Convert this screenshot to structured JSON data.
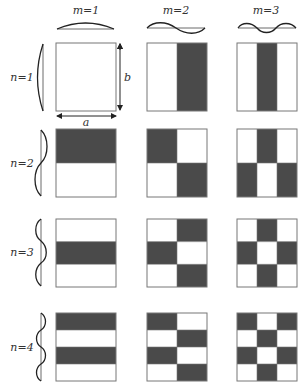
{
  "column_labels": [
    "m=1",
    "m=2",
    "m=3"
  ],
  "row_labels": [
    "n=1",
    "n=2",
    "n=3",
    "n=4"
  ],
  "dimension_labels": {
    "width": "a",
    "height": "b"
  },
  "colors": {
    "dark": "#4a4a4a",
    "light": "#ffffff",
    "frame": "#777777",
    "wave": "#222222"
  },
  "layout": {
    "columns_x": [
      56,
      147,
      237
    ],
    "rows_y": [
      43,
      129,
      219,
      313
    ],
    "cell_width": 60,
    "cell_height": 68
  },
  "patterns": {
    "n1": {
      "m1": [
        [
          0
        ]
      ],
      "m2": [
        [
          0,
          1
        ]
      ],
      "m3": [
        [
          0,
          1,
          0
        ]
      ]
    },
    "n2": {
      "m1": [
        [
          1
        ],
        [
          0
        ]
      ],
      "m2": [
        [
          1,
          0
        ],
        [
          0,
          1
        ]
      ],
      "m3": [
        [
          0,
          1,
          0
        ],
        [
          1,
          0,
          1
        ]
      ]
    },
    "n3": {
      "m1": [
        [
          0
        ],
        [
          1
        ],
        [
          0
        ]
      ],
      "m2": [
        [
          0,
          1
        ],
        [
          1,
          0
        ],
        [
          0,
          1
        ]
      ],
      "m3": [
        [
          0,
          1,
          0
        ],
        [
          1,
          0,
          1
        ],
        [
          0,
          1,
          0
        ]
      ]
    },
    "n4": {
      "m1": [
        [
          1
        ],
        [
          0
        ],
        [
          1
        ],
        [
          0
        ]
      ],
      "m2": [
        [
          1,
          0
        ],
        [
          0,
          1
        ],
        [
          1,
          0
        ],
        [
          0,
          1
        ]
      ],
      "m3": [
        [
          1,
          0,
          1
        ],
        [
          0,
          1,
          0
        ],
        [
          1,
          0,
          1
        ],
        [
          0,
          1,
          0
        ]
      ]
    }
  }
}
